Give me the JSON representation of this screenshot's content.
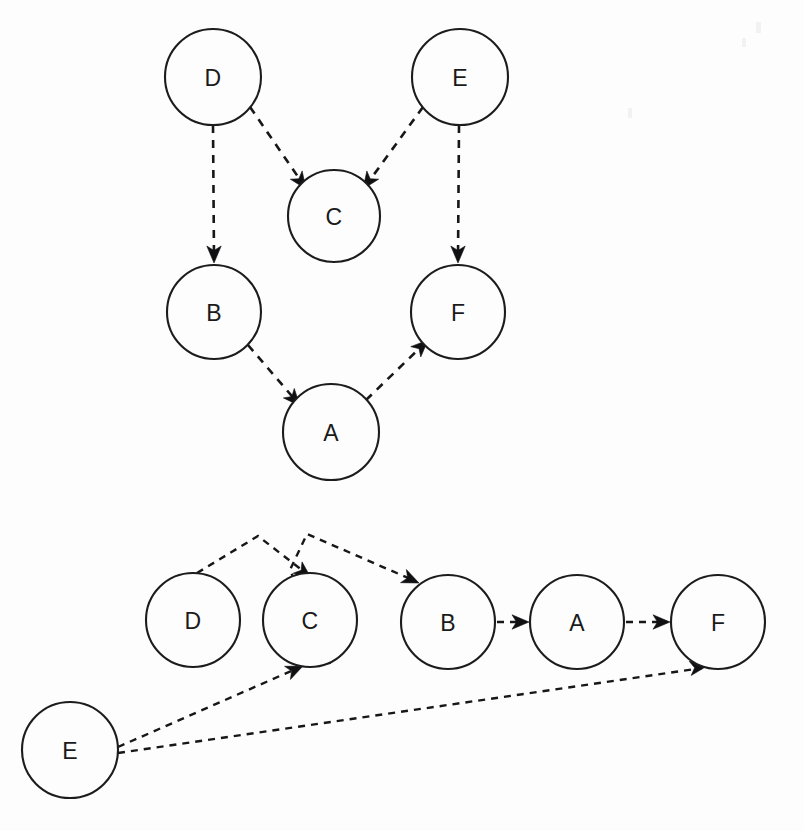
{
  "page": {
    "background_color": "#fdfdfd",
    "node_fill": "#fdfdfd",
    "node_stroke": "#1c1c1c",
    "edge_color": "#17171a",
    "label_color": "#1a1a1a",
    "width": 804,
    "height": 831
  },
  "graphs": [
    {
      "id": "graph-top",
      "name": "hierarchical-layered-layout",
      "edge_style": "dashed",
      "arrowheads": true,
      "nodes": [
        {
          "id": "D",
          "label": "D",
          "cx": 213,
          "cy": 77,
          "r": 48
        },
        {
          "id": "E",
          "label": "E",
          "cx": 460,
          "cy": 77,
          "r": 48
        },
        {
          "id": "C",
          "label": "C",
          "cx": 334,
          "cy": 216,
          "r": 46
        },
        {
          "id": "B",
          "label": "B",
          "cx": 214,
          "cy": 312,
          "r": 47
        },
        {
          "id": "F",
          "label": "F",
          "cx": 458,
          "cy": 312,
          "r": 47
        },
        {
          "id": "A",
          "label": "A",
          "cx": 331,
          "cy": 432,
          "r": 48
        }
      ],
      "edges": [
        {
          "from": "D",
          "to": "B",
          "shape": "straight"
        },
        {
          "from": "D",
          "to": "C",
          "shape": "straight"
        },
        {
          "from": "E",
          "to": "C",
          "shape": "straight"
        },
        {
          "from": "E",
          "to": "F",
          "shape": "straight"
        },
        {
          "from": "B",
          "to": "A",
          "shape": "straight"
        },
        {
          "from": "A",
          "to": "F",
          "shape": "straight"
        }
      ]
    },
    {
      "id": "graph-bottom",
      "name": "linear-chain-layout",
      "edge_style": "dashed",
      "arrowheads": true,
      "nodes": [
        {
          "id": "E",
          "label": "E",
          "cx": 70,
          "cy": 750,
          "r": 48
        },
        {
          "id": "D",
          "label": "D",
          "cx": 193,
          "cy": 620,
          "r": 47
        },
        {
          "id": "C",
          "label": "C",
          "cx": 310,
          "cy": 620,
          "r": 47
        },
        {
          "id": "B",
          "label": "B",
          "cx": 448,
          "cy": 622,
          "r": 47
        },
        {
          "id": "A",
          "label": "A",
          "cx": 577,
          "cy": 622,
          "r": 47
        },
        {
          "id": "F",
          "label": "F",
          "cx": 718,
          "cy": 622,
          "r": 47
        }
      ],
      "edges": [
        {
          "from": "D",
          "to": "C",
          "shape": "arc-over"
        },
        {
          "from": "C",
          "to": "B",
          "shape": "arc-over"
        },
        {
          "from": "B",
          "to": "A",
          "shape": "straight"
        },
        {
          "from": "A",
          "to": "F",
          "shape": "straight"
        },
        {
          "from": "E",
          "to": "C",
          "shape": "straight"
        },
        {
          "from": "E",
          "to": "F",
          "shape": "straight"
        }
      ]
    }
  ],
  "geometry": {
    "graph_top": {
      "paths": {
        "D_B": "M 213,125 L 214,258",
        "D_C": "M 250,107 L 303,184",
        "E_C": "M 423,107 L 367,184",
        "E_F": "M 459,125 L 458,258",
        "B_A": "M 248,345 L 297,402",
        "A_F": "M 366,400 L 424,344"
      },
      "arrows": {
        "D_B": {
          "x": 214,
          "y": 263,
          "angle": 90
        },
        "D_C": {
          "x": 306,
          "y": 189,
          "angle": 55
        },
        "E_C": {
          "x": 363,
          "y": 189,
          "angle": 125
        },
        "E_F": {
          "x": 458,
          "y": 263,
          "angle": 90
        },
        "B_A": {
          "x": 300,
          "y": 406,
          "angle": 49
        },
        "A_F": {
          "x": 428,
          "y": 340,
          "angle": -44
        }
      }
    },
    "graph_bottom": {
      "paths": {
        "D_C": "M 197,573 L 258,536 L 307,574",
        "C_B": "M 330,664 L 290,570 L 307,534 L 415,581",
        "B_A": "M 497,622 L 524,622",
        "A_F": "M 626,622 L 665,622",
        "E_C": "M 118,747 L 298,668",
        "E_F": "M 118,753 L 702,668"
      },
      "arrows": {
        "D_C": {
          "x": 311,
          "y": 578,
          "angle": 38
        },
        "C_B": {
          "x": 419,
          "y": 583,
          "angle": 24
        },
        "B_A": {
          "x": 529,
          "y": 622,
          "angle": 0
        },
        "A_F": {
          "x": 670,
          "y": 622,
          "angle": 0
        },
        "E_C": {
          "x": 303,
          "y": 666,
          "angle": -24
        },
        "E_F": {
          "x": 707,
          "y": 666,
          "angle": -8
        }
      }
    }
  }
}
